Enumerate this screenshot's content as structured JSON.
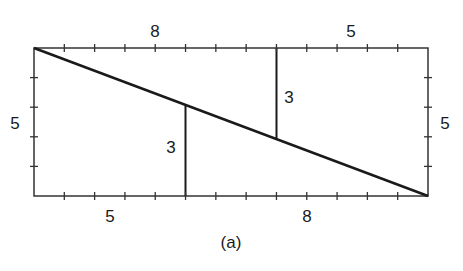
{
  "figure": {
    "caption": "(a)",
    "labels": {
      "top_left": "8",
      "top_right": "5",
      "bottom_left": "5",
      "bottom_right": "8",
      "left_side": "5",
      "right_side": "5",
      "inner_left_segment": "3",
      "inner_right_segment": "3"
    },
    "grid": {
      "width_units": 13,
      "height_units": 5
    },
    "line_color": "#1a1a1a",
    "background": "#ffffff"
  }
}
